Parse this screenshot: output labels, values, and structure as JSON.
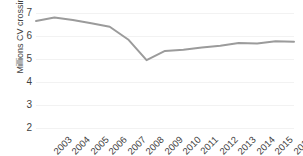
{
  "chart_data": {
    "type": "line",
    "title": "",
    "xlabel": "",
    "ylabel": "Millions CV crossing",
    "categories": [
      "2003",
      "2004",
      "2005",
      "2006",
      "2007",
      "2008",
      "2009",
      "2010",
      "2011",
      "2012",
      "2013",
      "2014",
      "2015",
      "2016",
      "2017"
    ],
    "values": [
      6.65,
      6.8,
      6.7,
      6.55,
      6.4,
      5.85,
      4.95,
      5.35,
      5.4,
      5.5,
      5.58,
      5.7,
      5.67,
      5.77,
      5.75
    ],
    "series": [
      {
        "name": "Millions CV crossing",
        "values": [
          6.65,
          6.8,
          6.7,
          6.55,
          6.4,
          5.85,
          4.95,
          5.35,
          5.4,
          5.5,
          5.58,
          5.7,
          5.67,
          5.77,
          5.75
        ]
      }
    ],
    "ylim": [
      2,
      7
    ],
    "yticks": [
      2,
      3,
      4,
      5,
      6,
      7
    ],
    "ytick_labels": [
      "2",
      "3",
      "4",
      "5",
      "6",
      "7"
    ],
    "grid": true,
    "grid_color": "#f2f2f2",
    "legend": false,
    "legend_position": "none",
    "line_color": "#9b9b9b",
    "line_width": 2,
    "background": "#ffffff",
    "text_color": "#3f3f3f",
    "xtick_rotation": -45
  }
}
